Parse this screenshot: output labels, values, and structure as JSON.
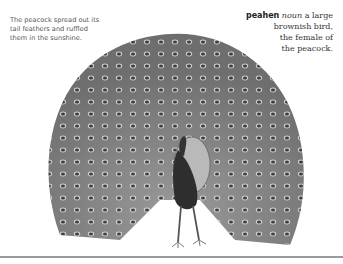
{
  "caption": {
    "line1": "The peacock spread out its",
    "line2": "tail feathers and ruffled",
    "line3": "them in the sunshine."
  },
  "entry": {
    "headword": "peahen",
    "part_of_speech": "noun",
    "def1": " a large",
    "def2": "brownish bird,",
    "def3": "the female of",
    "def4": "the peacock."
  },
  "illustration": {
    "subject": "peacock-with-spread-tail",
    "colors": {
      "feather": "#8a8a8a",
      "eye": "#3a3a3a",
      "body": "#2e2e2e",
      "rule": "#9a9a9a"
    }
  }
}
